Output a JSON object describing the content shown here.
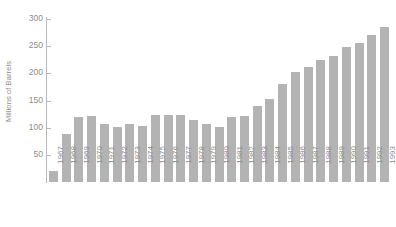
{
  "chart_data": {
    "type": "bar",
    "title": "",
    "subtitle": "",
    "xlabel": "",
    "ylabel": "Millions of Barrels",
    "ylim": [
      0,
      300
    ],
    "yticks": [
      0,
      50,
      100,
      150,
      200,
      250,
      300
    ],
    "ytick_labels": [
      "",
      "50",
      "100",
      "150",
      "200",
      "250",
      "300"
    ],
    "grid": false,
    "legend": null,
    "bar_color": "#b3b3b3",
    "axis_color": "#b9b9b9",
    "text_color": "#8c8c8c",
    "categories": [
      "1967",
      "1968",
      "1969",
      "1970",
      "1971",
      "1972",
      "1973",
      "1974",
      "1975",
      "1976",
      "1977",
      "1978",
      "1979",
      "1980",
      "1981",
      "1982",
      "1983",
      "1984",
      "1985",
      "1986",
      "1987",
      "1988",
      "1989",
      "1990",
      "1991",
      "1992",
      "1993"
    ],
    "values": [
      20,
      88,
      120,
      121,
      107,
      101,
      106,
      104,
      124,
      124,
      123,
      114,
      106,
      101,
      119,
      122,
      140,
      152,
      180,
      203,
      211,
      225,
      232,
      248,
      256,
      270,
      285
    ]
  }
}
